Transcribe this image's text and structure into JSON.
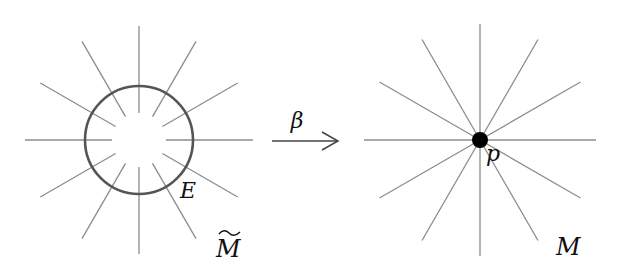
{
  "diagram": {
    "type": "blow-up map",
    "left_figure": {
      "name": "blown-up space",
      "space_label": "M",
      "space_label_decoration": "tilde",
      "exceptional_divisor_label": "E",
      "center": [
        139,
        140
      ],
      "circle_radius": 54,
      "ray_count": 12,
      "ray_inner_radius": 27,
      "ray_outer_radius": 114
    },
    "map": {
      "label": "β",
      "direction": "left-to-right"
    },
    "right_figure": {
      "name": "original space",
      "space_label": "M",
      "point_label": "p",
      "center": [
        480,
        140
      ],
      "point_radius": 8,
      "ray_count": 12,
      "ray_outer_radius": 116
    },
    "colors": {
      "rays": "#8c8c8c",
      "circle": "#555555",
      "point": "#000000",
      "arrow": "#444444",
      "text": "#111111"
    }
  }
}
